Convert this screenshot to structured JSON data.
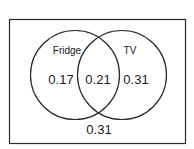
{
  "diagram": {
    "type": "venn",
    "sets": [
      {
        "name": "Fridge",
        "only_value": "0.17"
      },
      {
        "name": "TV",
        "only_value": "0.31"
      }
    ],
    "intersection_value": "0.21",
    "outside_value": "0.31",
    "colors": {
      "stroke": "#2a2a2a",
      "background": "#ffffff",
      "text": "#1a1a1a"
    }
  },
  "labels": {
    "fridge": "Fridge",
    "tv": "TV",
    "fridge_only": "0.17",
    "both": "0.21",
    "tv_only": "0.31",
    "neither": "0.31"
  }
}
